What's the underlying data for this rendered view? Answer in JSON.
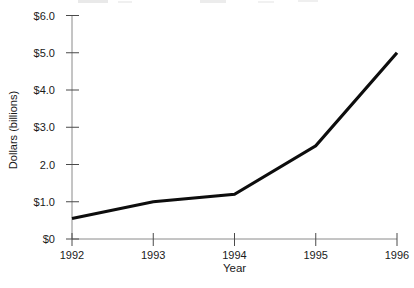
{
  "chart_data": {
    "type": "line",
    "title": "",
    "xlabel": "Year",
    "ylabel": "Dollars (billions)",
    "categories": [
      1992,
      1993,
      1994,
      1995,
      1996
    ],
    "xtick_labels": [
      "1992",
      "1993",
      "1994",
      "1995",
      "1996"
    ],
    "series": [
      {
        "name": "Dollars (billions)",
        "values": [
          0.55,
          1.0,
          1.2,
          2.5,
          5.0
        ]
      }
    ],
    "xlim": [
      1992,
      1996
    ],
    "ylim": [
      0,
      6
    ],
    "ytick_values": [
      0,
      1,
      2,
      3,
      4,
      5,
      6
    ],
    "ytick_labels": [
      "$0",
      "$1.0",
      "2.0",
      "$3.0",
      "$4.0",
      "$5.0",
      "$6.0"
    ],
    "grid": false,
    "legend_position": "none",
    "line_color": "#0d0d0d",
    "line_width": 3.2,
    "axis_color": "#8a8a8a",
    "tick_color": "#4a4a4a",
    "label_color": "#1a1a1a",
    "background_color": "#ffffff"
  }
}
